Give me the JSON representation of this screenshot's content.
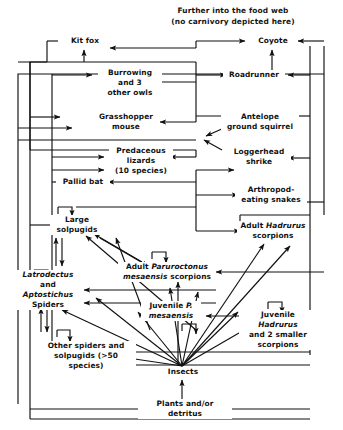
{
  "diagram": {
    "type": "food-web",
    "title_line1": "Further into the food web",
    "title_line2": "(no carnivory depicted here)",
    "colors": {
      "ink": "#111111",
      "background": "#ffffff"
    },
    "nodes": [
      {
        "id": "kit_fox",
        "label": "Kit fox",
        "x": 84,
        "y": 41,
        "w": 52
      },
      {
        "id": "coyote",
        "label": "Coyote",
        "x": 272,
        "y": 41,
        "w": 48
      },
      {
        "id": "owls",
        "label": "Burrowing\nand 3\nother owls",
        "x": 129,
        "y": 83,
        "w": 62
      },
      {
        "id": "roadrunner",
        "label": "Roadrunner",
        "x": 253,
        "y": 75,
        "w": 60
      },
      {
        "id": "grasshopper",
        "label": "Grasshopper\nmouse",
        "x": 125,
        "y": 122,
        "w": 66
      },
      {
        "id": "squirrel",
        "label": "Antelope\nground squirrel",
        "x": 259,
        "y": 122,
        "w": 76
      },
      {
        "id": "lizards",
        "label": "Predaceous\nlizards\n(10 species)",
        "x": 140,
        "y": 161,
        "w": 62
      },
      {
        "id": "shrike",
        "label": "Loggerhead\nshrike",
        "x": 258,
        "y": 157,
        "w": 62
      },
      {
        "id": "pallid_bat",
        "label": "Pallid bat",
        "x": 82,
        "y": 182,
        "w": 52
      },
      {
        "id": "snakes",
        "label": "Arthropod-\neating snakes",
        "x": 270,
        "y": 195,
        "w": 70
      },
      {
        "id": "large_solpug",
        "label": "Large\nsolpugids",
        "x": 76,
        "y": 225,
        "w": 52
      },
      {
        "id": "adult_hadrurus",
        "label": "Adult Hadrurus\nscorpions",
        "x": 272,
        "y": 231,
        "w": 70,
        "italic_words": [
          "Hadrurus"
        ]
      },
      {
        "id": "adult_paruro",
        "label": "Adult Paruroctonus\nmesaensis scorpions",
        "x": 166,
        "y": 272,
        "w": 96,
        "italic_words": [
          "Paruroctonus",
          "mesaensis"
        ]
      },
      {
        "id": "latro",
        "label": "Latrodectus\nand\nAptostichus\nSpiders",
        "x": 47,
        "y": 290,
        "w": 60,
        "italic_words": [
          "Latrodectus",
          "Aptostichus"
        ]
      },
      {
        "id": "juv_paruro",
        "label": "Juvenile P.\nmesaensis",
        "x": 170,
        "y": 311,
        "w": 58,
        "italic_words": [
          "P.",
          "mesaensis"
        ]
      },
      {
        "id": "juv_hadrurus",
        "label": "Juvenile Hadrurus\nand 2 smaller\nscorpions",
        "x": 277,
        "y": 330,
        "w": 76,
        "italic_words": [
          "Hadrurus"
        ]
      },
      {
        "id": "other_spiders",
        "label": "Other spiders and\nsolpugids (>50 species)",
        "x": 85,
        "y": 356,
        "w": 98
      },
      {
        "id": "insects",
        "label": "Insects",
        "x": 182,
        "y": 372,
        "w": 40
      },
      {
        "id": "plants",
        "label": "Plants and/or detritus",
        "x": 184,
        "y": 409,
        "w": 92
      }
    ],
    "trophic_note": "Arrows point from prey to predator; energy flows upward from plants and/or detritus through insects to arthropod and vertebrate consumers."
  }
}
